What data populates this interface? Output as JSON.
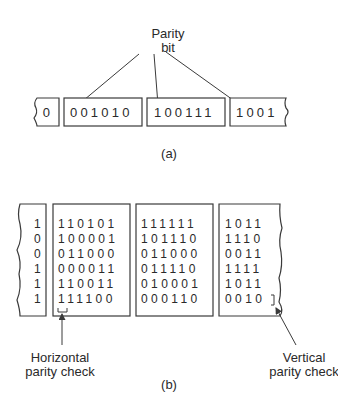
{
  "part_a": {
    "callout_line1": "Parity",
    "callout_line2": "bit",
    "boxes": [
      {
        "bits": "0",
        "partial": "left"
      },
      {
        "bits": "001010"
      },
      {
        "bits": "100111"
      },
      {
        "bits": "1001",
        "partial": "right"
      }
    ],
    "caption": "(a)"
  },
  "part_b": {
    "columns": [
      {
        "partial": "left",
        "rows": [
          "1",
          "0",
          "0",
          "1",
          "1",
          "1"
        ]
      },
      {
        "rows": [
          "110101",
          "100001",
          "011000",
          "000011",
          "110011",
          "111100"
        ]
      },
      {
        "rows": [
          "111111",
          "101110",
          "011000",
          "011110",
          "010001",
          "000110"
        ]
      },
      {
        "partial": "right",
        "rows": [
          "1011",
          "1110",
          "0011",
          "1111",
          "1011",
          "0010"
        ]
      }
    ],
    "horizontal_label_line1": "Horizontal",
    "horizontal_label_line2": "parity check",
    "vertical_label_line1": "Vertical",
    "vertical_label_line2": "parity check",
    "caption": "(b)"
  }
}
